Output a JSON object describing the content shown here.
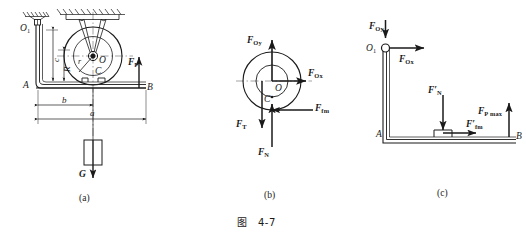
{
  "figure": {
    "caption": "图　4-7",
    "background_color": "#ffffff",
    "line_color": "#1a1a1a",
    "subfigures": [
      {
        "id": "a",
        "label": "(a)"
      },
      {
        "id": "b",
        "label": "(b)"
      },
      {
        "id": "c",
        "label": "(c)"
      }
    ]
  },
  "panel_a": {
    "points": {
      "pivot": "O",
      "pivot_sub": "1",
      "wheel_center": "O",
      "contact_point": "C",
      "left_end": "A",
      "right_end": "B"
    },
    "dimensions": {
      "horizontal_short": "b",
      "horizontal_long": "a",
      "vertical_tall": "c",
      "vertical_short": "R",
      "wheel_radius": "r"
    },
    "forces": [
      {
        "name": "applied-force",
        "symbol": "F",
        "sub": "P",
        "direction": "up"
      },
      {
        "name": "weight",
        "symbol": "G",
        "sub": "",
        "direction": "down"
      }
    ]
  },
  "panel_b": {
    "points": {
      "wheel_center": "O",
      "contact_point": "C"
    },
    "forces": [
      {
        "name": "reaction-vertical",
        "symbol": "F",
        "sub": "Oy",
        "direction": "up"
      },
      {
        "name": "reaction-horizontal",
        "symbol": "F",
        "sub": "Ox",
        "direction": "right"
      },
      {
        "name": "tension-force",
        "symbol": "F",
        "sub": "T",
        "direction": "down"
      },
      {
        "name": "normal-force",
        "symbol": "F",
        "sub": "N",
        "direction": "up"
      },
      {
        "name": "friction-force",
        "symbol": "F",
        "sub": "fm",
        "direction": "right"
      }
    ]
  },
  "panel_c": {
    "points": {
      "pivot": "O",
      "pivot_sub": "1",
      "left_end": "A",
      "right_end": "B"
    },
    "forces": [
      {
        "name": "reaction-vertical",
        "symbol": "F",
        "sub": "Oy",
        "direction": "up"
      },
      {
        "name": "reaction-horizontal",
        "symbol": "F",
        "sub": "Ox",
        "direction": "right"
      },
      {
        "name": "normal-reaction",
        "symbol": "F",
        "sub": "N",
        "prime": "′",
        "direction": "down"
      },
      {
        "name": "friction-reaction",
        "symbol": "F",
        "sub": "fm",
        "prime": "′",
        "direction": "right"
      },
      {
        "name": "max-applied-force",
        "symbol": "F",
        "sub": "P max",
        "direction": "up"
      }
    ]
  }
}
